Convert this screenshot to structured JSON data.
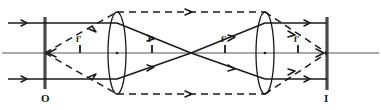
{
  "figure": {
    "type": "optical-ray-diagram",
    "background_color": "#ffffff",
    "ink_color": "#1a1a1a",
    "axis_color": "#8c8c8c",
    "width": 381,
    "height": 110
  },
  "labels": {
    "object_plane": "O",
    "image_plane": "I",
    "focal_1": "f'",
    "focal_2": "f'",
    "focal_3": "f'",
    "focal_4": "f'"
  },
  "geometry": {
    "optical_axis_y": 53,
    "object_plane_x": 45,
    "image_plane_x": 327,
    "lens1_x": 117,
    "lens2_x": 265,
    "crossover_x": 191,
    "upper_ray_y": 23,
    "lower_ray_y": 79,
    "lens_top_y": 12,
    "lens_bottom_y": 94,
    "screen_top_y": 17,
    "screen_bottom_y": 89
  },
  "marks": {
    "tick_positions_x": [
      80,
      152,
      225,
      298
    ],
    "node_positions_x": [
      117,
      265
    ]
  },
  "legend": {
    "solid_ray": "marginal / aperture rays (solid)",
    "dashed_ray": "chief / field rays (dashed)"
  }
}
